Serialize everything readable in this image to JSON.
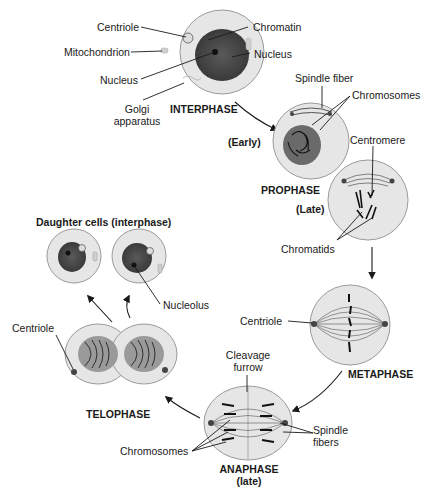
{
  "stages": {
    "interphase": "INTERPHASE",
    "prophase": "PROPHASE",
    "prophase_early": "(Early)",
    "prophase_late": "(Late)",
    "metaphase": "METAPHASE",
    "anaphase": "ANAPHASE",
    "anaphase_late": "(late)",
    "telophase": "TELOPHASE",
    "daughter_cells": "Daughter cells (interphase)"
  },
  "labels": {
    "centriole_interphase": "Centriole",
    "mitochondrion": "Mitochondrion",
    "nucleus_left": "Nucleus",
    "golgi_1": "Golgi",
    "golgi_2": "apparatus",
    "chromatin": "Chromatin",
    "nucleus_right": "Nucleus",
    "spindle_fiber": "Spindle fiber",
    "chromosomes_prophase": "Chromosomes",
    "centromere": "Centromere",
    "chromatids": "Chromatids",
    "centriole_metaphase": "Centriole",
    "cleavage_1": "Cleavage",
    "cleavage_2": "furrow",
    "spindle_fibers_1": "Spindle",
    "spindle_fibers_2": "fibers",
    "chromosomes_anaphase": "Chromosomes",
    "nucleolus": "Nucleolus",
    "centriole_telophase": "Centriole"
  },
  "colors": {
    "cytoplasm": "#e6e6e6",
    "cell_border": "#9a9a9a",
    "nucleus": "#4a4a4a",
    "ink": "#1a1a1a"
  }
}
